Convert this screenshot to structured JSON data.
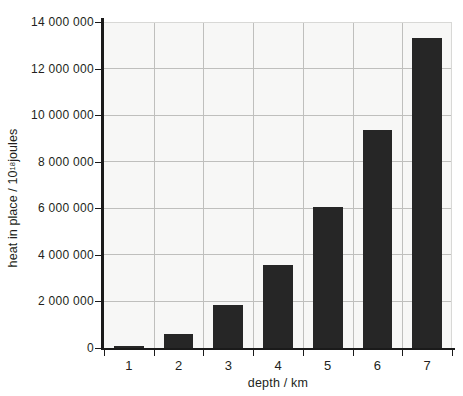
{
  "chart_data": {
    "type": "bar",
    "title": "",
    "subtitle": "",
    "xlabel": "depth / km",
    "ylabel": "heat in place / 10¹⁸ joules",
    "ylabel_parts": {
      "prefix": "heat in place / 10",
      "exponent": "18",
      "suffix": " joules"
    },
    "categories": [
      "1",
      "2",
      "3",
      "4",
      "5",
      "6",
      "7"
    ],
    "values": [
      100000,
      620000,
      1850000,
      3560000,
      6050000,
      9360000,
      13300000
    ],
    "ylim": [
      0,
      14000000
    ],
    "xlim_categories": 7,
    "ytick_values": [
      0,
      2000000,
      4000000,
      6000000,
      8000000,
      10000000,
      12000000,
      14000000
    ],
    "ytick_labels": [
      "0",
      "2 000 000",
      "4 000 000",
      "6 000 000",
      "8 000 000",
      "10 000 000",
      "12 000 000",
      "14 000 000"
    ],
    "grid": {
      "horizontal": true,
      "vertical": true,
      "color": "#bfbfbd"
    },
    "legend": null,
    "legend_position": "none",
    "annotations": [],
    "colors": {
      "bar": "#262626",
      "plot_background": "#f7f7f6",
      "figure_background": "#ffffff",
      "axis": "#1a1a1a",
      "text": "#231f20",
      "gridline": "#bfbfbd"
    }
  }
}
